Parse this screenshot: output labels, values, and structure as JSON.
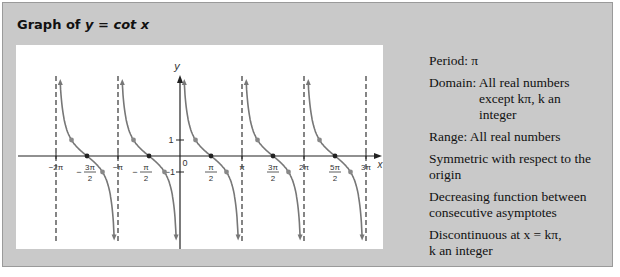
{
  "title": {
    "prefix": "Graph of ",
    "eq": "y = cot x"
  },
  "properties": [
    {
      "id": "period",
      "lines": [
        "Period: π"
      ]
    },
    {
      "id": "domain",
      "lines": [
        "Domain: All real numbers",
        "except kπ, k an",
        "integer"
      ]
    },
    {
      "id": "range",
      "lines": [
        "Range: All real numbers"
      ]
    },
    {
      "id": "symmetry",
      "lines": [
        "Symmetric with respect to the",
        "origin"
      ]
    },
    {
      "id": "decreasing",
      "lines": [
        "Decreasing function between",
        "consecutive asymptotes"
      ]
    },
    {
      "id": "discontinuous",
      "lines": [
        "Discontinuous at x = kπ,",
        "k an integer"
      ]
    }
  ],
  "axes": {
    "x_label": "x",
    "y_label": "y",
    "origin_label": "0",
    "y_ticks": [
      "1",
      "−1"
    ]
  },
  "x_tick_labels": [
    "−2π",
    "−3π/2",
    "−π",
    "−π/2",
    "π/2",
    "π",
    "3π/2",
    "2π",
    "5π/2",
    "3π"
  ],
  "chart_data": {
    "type": "line",
    "title": "Graph of y = cot x",
    "function": "y = cot x",
    "xlabel": "x",
    "ylabel": "y",
    "x_range_radians": [
      -6.5,
      9.6
    ],
    "asymptotes": [
      "−2π",
      "−π",
      "0",
      "π",
      "2π",
      "3π"
    ],
    "zeros": [
      "−3π/2",
      "−π/2",
      "π/2",
      "3π/2",
      "5π/2"
    ],
    "marked_points": [
      {
        "x": "−7π/4",
        "y": 1
      },
      {
        "x": "−3π/2",
        "y": 0
      },
      {
        "x": "−5π/4",
        "y": -1
      },
      {
        "x": "−3π/4",
        "y": 1
      },
      {
        "x": "−π/2",
        "y": 0
      },
      {
        "x": "−π/4",
        "y": -1
      },
      {
        "x": "π/4",
        "y": 1
      },
      {
        "x": "π/2",
        "y": 0
      },
      {
        "x": "3π/4",
        "y": -1
      },
      {
        "x": "5π/4",
        "y": 1
      },
      {
        "x": "3π/2",
        "y": 0
      },
      {
        "x": "7π/4",
        "y": -1
      },
      {
        "x": "9π/4",
        "y": 1
      },
      {
        "x": "5π/2",
        "y": 0
      },
      {
        "x": "11π/4",
        "y": -1
      }
    ],
    "y_ticks": [
      1,
      -1
    ],
    "grid": false
  }
}
